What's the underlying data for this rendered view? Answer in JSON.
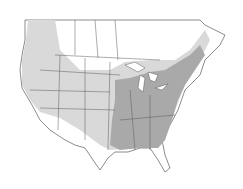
{
  "map": {
    "type": "species-range-map",
    "region": "North America (USA & southern Canada)",
    "colors": {
      "background": "#ffffff",
      "land": "#ffffff",
      "range_light": "#d9d9d9",
      "range_dark": "#a9a9a9",
      "borders": "#5a5a5a",
      "water": "#ffffff"
    },
    "legend": null,
    "labels": []
  }
}
